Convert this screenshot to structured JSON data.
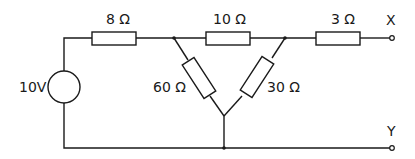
{
  "diagram": {
    "type": "circuit",
    "source": {
      "label": "10V",
      "value_volts": 10
    },
    "resistors": [
      {
        "id": "R1",
        "label": "8 Ω",
        "ohms": 8,
        "position": "top-left series"
      },
      {
        "id": "R2",
        "label": "10 Ω",
        "ohms": 10,
        "position": "top-middle delta"
      },
      {
        "id": "R3",
        "label": "3 Ω",
        "ohms": 3,
        "position": "top-right series"
      },
      {
        "id": "R4",
        "label": "60 Ω",
        "ohms": 60,
        "position": "left delta leg"
      },
      {
        "id": "R5",
        "label": "30 Ω",
        "ohms": 30,
        "position": "right delta leg"
      }
    ],
    "terminals": [
      {
        "id": "X",
        "label": "X"
      },
      {
        "id": "Y",
        "label": "Y"
      }
    ]
  }
}
